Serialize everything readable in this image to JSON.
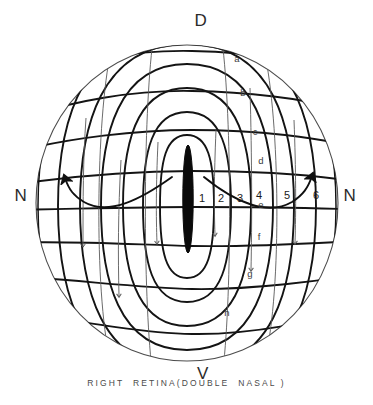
{
  "figure": {
    "title_caption": "RIGHT  RETINA(DOUBLE  NASAL )",
    "cardinals": {
      "dorsal": "D",
      "ventral": "V",
      "nasal_left": "N",
      "nasal_right": "N"
    },
    "meridian_labels": [
      "1",
      "2",
      "3",
      "4",
      "5",
      "6"
    ],
    "parallel_labels": [
      "a",
      "b",
      "c",
      "d",
      "e",
      "f",
      "g",
      "h"
    ],
    "colors": {
      "background": "#ffffff",
      "grid_line": "#141414",
      "outline": "#4d4d4d",
      "optic_disc": "#0a0a0a",
      "flow_arrow": "#5a5a5a",
      "curved_arrow": "#101010",
      "text": "#1a1a1a"
    }
  }
}
